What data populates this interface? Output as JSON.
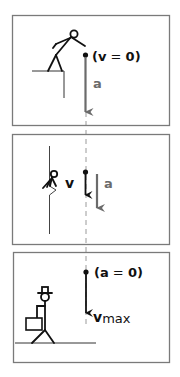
{
  "diagram": {
    "colors": {
      "frame": "#7a7a7a",
      "ink": "#111111",
      "accel": "#6b6b6b",
      "dash": "#9a9a9a"
    },
    "panels": [
      {
        "id": "jump",
        "label_state": "(v = 0)",
        "label_state_parts": {
          "open": "(",
          "var": "v",
          "eq": " = ",
          "val": "0",
          "close": ")"
        },
        "label_accel": "a",
        "figure": "stick-figure-jumping-off-cliff"
      },
      {
        "id": "falling",
        "label_velocity": "v",
        "label_accel": "a",
        "figure": "stick-figure-falling-along-cliff"
      },
      {
        "id": "terminal",
        "label_state": "(a = 0)",
        "label_state_parts": {
          "open": "(",
          "var": "a",
          "eq": " = ",
          "val": "0",
          "close": ")"
        },
        "label_velocity": "v",
        "label_velocity_sub": "max",
        "figure": "stick-figure-with-hat-and-briefcase"
      }
    ]
  }
}
